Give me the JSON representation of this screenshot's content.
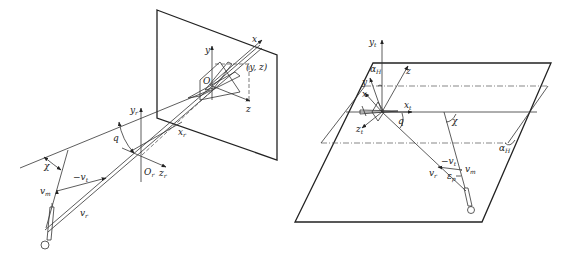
{
  "left_panel": {
    "labels": {
      "x": "x",
      "y": "y",
      "z": "z",
      "O": "O",
      "yz": "(y, z)",
      "yr": "y",
      "yr_sub": "r",
      "xr": "x",
      "xr_sub": "r",
      "zr": "z",
      "zr_sub": "r",
      "Or": "O",
      "Or_sub": "r",
      "q": "q",
      "chi": "χ",
      "neg_vt": "−v",
      "neg_vt_sub": "t",
      "vm": "v",
      "vm_sub": "m",
      "vr": "v",
      "vr_sub": "r"
    }
  },
  "right_panel": {
    "labels": {
      "yt": "y",
      "yt_sub": "t",
      "alpha_top": "α",
      "alpha_top_sub": "H",
      "z": "z",
      "y": "y",
      "x": "x",
      "xt": "x",
      "xt_sub": "t",
      "zt": "z",
      "zt_sub": "t",
      "q": "q",
      "chi": "χ",
      "alpha_right": "α",
      "alpha_right_sub": "H",
      "neg_vt": "−v",
      "neg_vt_sub": "t",
      "vr": "v",
      "vr_sub": "r",
      "vm": "v",
      "vm_sub": "m",
      "eps": "ε",
      "eps_sub": "p"
    }
  }
}
